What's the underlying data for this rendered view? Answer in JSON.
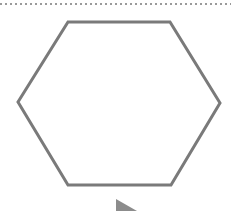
{
  "canvas": {
    "width": 231,
    "height": 211,
    "background": "#ffffff"
  },
  "divider": {
    "style": "dotted",
    "y": 4,
    "color": "#9a9a9a"
  },
  "hexagon": {
    "shape": "hexagon",
    "stroke": "#7a7a7a",
    "stroke_width": 3,
    "fill": "none",
    "points": "68,22 170,22 220,103 171,185 68,185 18,102"
  },
  "play_marker": {
    "icon": "play-triangle-icon",
    "color": "#8c8c8c",
    "points": "116,199 116,215 136,211"
  }
}
